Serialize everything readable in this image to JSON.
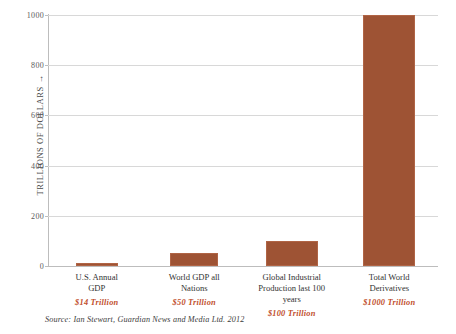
{
  "chart_data": {
    "type": "bar",
    "title": "",
    "xlabel": "",
    "ylabel": "TRILLIONS OF DOLLARS →",
    "ylim": [
      0,
      1000
    ],
    "yticks": [
      0,
      200,
      400,
      600,
      800,
      1000
    ],
    "ytick_labels": [
      "0",
      "200",
      "400",
      "600",
      "800",
      "1000"
    ],
    "grid": true,
    "legend": false,
    "bar_color": "#9e5334",
    "value_label_color": "#c1502e",
    "categories": [
      "U.S. Annual GDP",
      "World GDP all Nations",
      "Global Industrial Production last 100 years",
      "Total World Derivatives"
    ],
    "category_lines": [
      [
        "U.S. Annual",
        "GDP"
      ],
      [
        "World GDP all",
        "Nations"
      ],
      [
        "Global Industrial",
        "Production last 100",
        "years"
      ],
      [
        "Total World",
        "Derivatives"
      ]
    ],
    "values": [
      14,
      50,
      100,
      1000
    ],
    "value_labels": [
      "$14 Trillion",
      "$50 Trillion",
      "$100 Trillion",
      "$1000 Trillion"
    ]
  },
  "source": {
    "text": "Source:  Ian Stewart, Guardian News and Media Ltd. 2012"
  }
}
